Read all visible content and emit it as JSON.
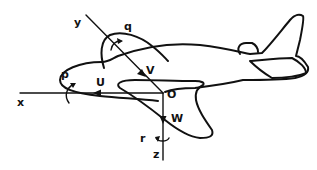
{
  "diagram": {
    "origin_label": "O",
    "axes": [
      {
        "name": "x",
        "label": "x",
        "linear_velocity": "U",
        "angular_velocity": "p"
      },
      {
        "name": "y",
        "label": "y",
        "linear_velocity": "V",
        "angular_velocity": "q"
      },
      {
        "name": "z",
        "label": "z",
        "linear_velocity": "W",
        "angular_velocity": "r"
      }
    ],
    "colors": {
      "ink": "#111111",
      "background": "#ffffff"
    }
  }
}
